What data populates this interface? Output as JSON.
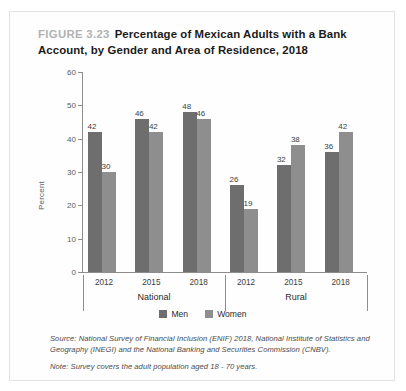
{
  "figure": {
    "number_label": "FIGURE 3.23",
    "title": "Percentage of Mexican Adults with a Bank Account, by Gender and Area of Residence, 2018"
  },
  "legend": {
    "men_label": "Men",
    "women_label": "Women",
    "men_color": "#6e6e6e",
    "women_color": "#8e8e8e"
  },
  "notes": {
    "source": "Source: National Survey of Financial Inclusion (ENIF) 2018, National Institute of Statistics and Geography (INEGI) and the National Banking and Securities Commission (CNBV).",
    "note": "Note: Survey covers the adult population aged 18 - 70 years."
  },
  "chart_data": {
    "type": "bar",
    "title": "Percentage of Mexican Adults with a Bank Account, by Gender and Area of Residence, 2018",
    "xlabel": "",
    "ylabel": "Percent",
    "ylim": [
      0,
      60
    ],
    "yticks": [
      0,
      10,
      20,
      30,
      40,
      50,
      60
    ],
    "grid": false,
    "legend_position": "bottom",
    "groups": [
      "National",
      "Rural"
    ],
    "categories": [
      "2012",
      "2015",
      "2018",
      "2012",
      "2015",
      "2018"
    ],
    "series": [
      {
        "name": "Men",
        "values": [
          42,
          46,
          48,
          26,
          32,
          36
        ]
      },
      {
        "name": "Women",
        "values": [
          30,
          42,
          46,
          19,
          38,
          42
        ]
      }
    ],
    "bars": [
      {
        "group": "National",
        "year": "2012",
        "men": 42,
        "women": 30
      },
      {
        "group": "National",
        "year": "2015",
        "men": 46,
        "women": 42
      },
      {
        "group": "National",
        "year": "2018",
        "men": 48,
        "women": 46
      },
      {
        "group": "Rural",
        "year": "2012",
        "men": 26,
        "women": 19
      },
      {
        "group": "Rural",
        "year": "2015",
        "men": 32,
        "women": 38
      },
      {
        "group": "Rural",
        "year": "2018",
        "men": 36,
        "women": 42
      }
    ]
  }
}
